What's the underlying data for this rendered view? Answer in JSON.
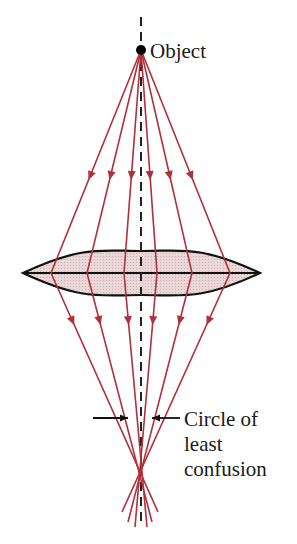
{
  "figure": {
    "labels": {
      "object": "Object",
      "circle_line1": "Circle of",
      "circle_line2": "least",
      "circle_line3": "confusion"
    },
    "colors": {
      "ray": "#b0303c",
      "lens_fill": "#e8d6d6",
      "lens_stroke": "#111111",
      "axis": "#222222",
      "text": "#1a1a1a"
    },
    "object_point": {
      "x": 141,
      "y": 50
    },
    "axis": {
      "x": 141,
      "y_top": 17,
      "y_bottom": 525
    },
    "lens": {
      "left_x": 23,
      "right_x": 260,
      "center_y": 273,
      "top_y": 251,
      "bottom_y": 295
    },
    "rays": [
      {
        "name": "ray-outer-left",
        "lens_x": 51,
        "end": [
          158,
          512
        ]
      },
      {
        "name": "ray-mid-left",
        "lens_x": 87,
        "end": [
          152,
          522
        ]
      },
      {
        "name": "ray-inner-left",
        "lens_x": 124,
        "end": [
          147,
          527
        ]
      },
      {
        "name": "ray-inner-right",
        "lens_x": 157,
        "end": [
          135,
          527
        ]
      },
      {
        "name": "ray-mid-right",
        "lens_x": 192,
        "end": [
          128,
          522
        ]
      },
      {
        "name": "ray-outer-right",
        "lens_x": 230,
        "end": [
          122,
          512
        ]
      }
    ],
    "circle_marker": {
      "y": 418,
      "left_from": 93,
      "left_to": 128,
      "right_from": 180,
      "right_to": 152
    }
  }
}
